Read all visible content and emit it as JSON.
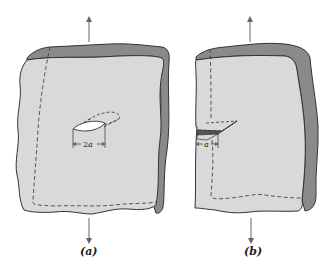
{
  "figure": {
    "colors": {
      "face": "#d9d9d9",
      "side": "#8a8a8a",
      "outline": "#333333",
      "crack_opening": "#ffffff",
      "arrow": "#666666"
    },
    "panels": [
      {
        "id": "a",
        "caption": "(a)",
        "crack_type": "central through-thickness crack",
        "dimension_label_prefix": "2",
        "dimension_label_var": "a",
        "load_arrows": [
          "up",
          "down"
        ]
      },
      {
        "id": "b",
        "caption": "(b)",
        "crack_type": "edge crack",
        "dimension_label_prefix": "",
        "dimension_label_var": "a",
        "load_arrows": [
          "up",
          "down"
        ]
      }
    ]
  }
}
